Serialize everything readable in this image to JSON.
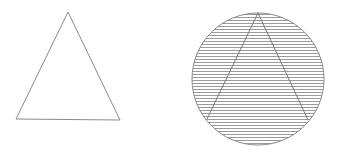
{
  "figure": {
    "width": 341,
    "height": 157,
    "background": "#ffffff",
    "stroke_color": "#8a8a8a",
    "hatch_color": "#9a9a9a",
    "left_shape": {
      "kind": "triangle",
      "fill": "none",
      "points": [
        [
          68,
          12
        ],
        [
          16,
          119
        ],
        [
          120,
          120
        ]
      ]
    },
    "right_shape": {
      "kind": "circle-with-inscribed-triangle",
      "circle": {
        "cx": 258,
        "cy": 79,
        "r": 66
      },
      "fill_pattern": "horizontal-hatch",
      "hatch_spacing": 3,
      "triangle_points": [
        [
          258,
          13
        ],
        [
          207,
          119
        ],
        [
          308,
          120
        ]
      ]
    }
  }
}
